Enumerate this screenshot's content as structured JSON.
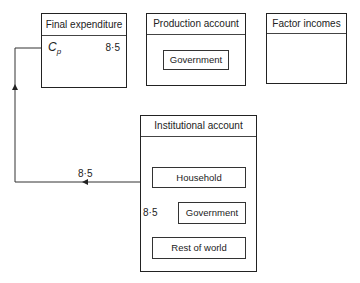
{
  "accounts": {
    "final_expenditure": {
      "title": "Final expenditure",
      "entry_symbol": "C",
      "entry_subscript": "p",
      "entry_value": "8·5"
    },
    "production_account": {
      "title": "Production account",
      "inner": "Government"
    },
    "factor_incomes": {
      "title": "Factor incomes"
    },
    "institutional_account": {
      "title": "Institutional account",
      "household": "Household",
      "government": "Government",
      "rest_of_world": "Rest of world"
    }
  },
  "flows": {
    "household_to_final_expenditure": "8·5",
    "rest_of_world_to_household": "8·5"
  }
}
